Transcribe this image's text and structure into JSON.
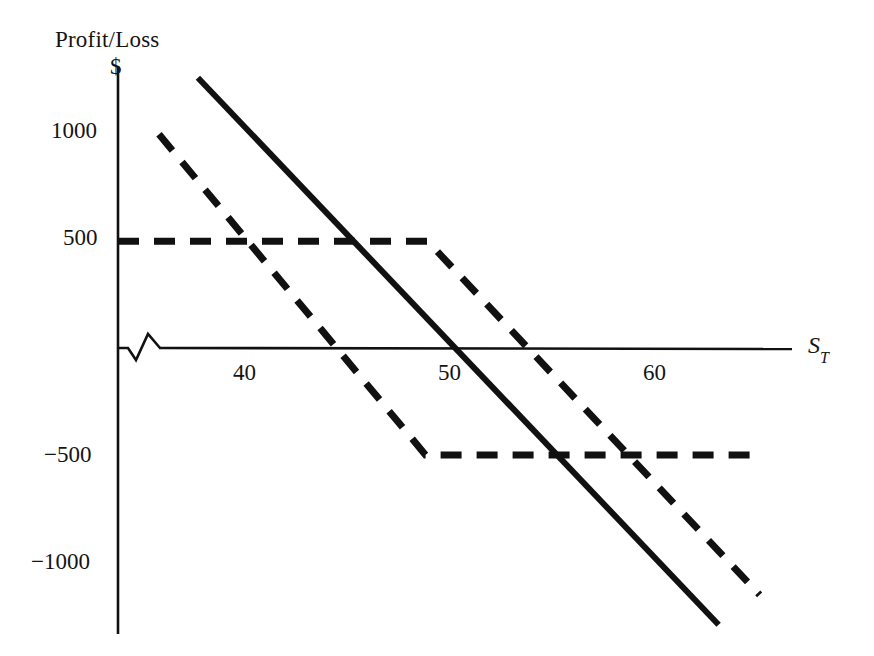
{
  "chart_data": {
    "type": "line",
    "title": "",
    "ylabel": "Profit/Loss",
    "yunit": "$",
    "xlabel": "S_T",
    "xlabel_base": "S",
    "xlabel_sub": "T",
    "xlim": [
      35,
      71
    ],
    "ylim": [
      -1300,
      1300
    ],
    "grid": false,
    "legend": "none",
    "axis_break_symbol": true,
    "yticks": [
      1000,
      500,
      -500,
      -1000
    ],
    "ytick_labels": [
      "1000",
      "500",
      "−500",
      "−1000"
    ],
    "xticks": [
      40,
      50,
      60
    ],
    "xtick_labels": [
      "40",
      "50",
      "60"
    ],
    "series": [
      {
        "name": "solid-payoff",
        "style": "solid",
        "color": "#111111",
        "width": 6,
        "points": [
          {
            "x": 38.9,
            "y": 1265
          },
          {
            "x": 64.3,
            "y": -1295
          }
        ]
      },
      {
        "name": "dashed-payoff-kink-down",
        "style": "dashed",
        "color": "#111111",
        "width": 7,
        "points": [
          {
            "x": 37.0,
            "y": 1000
          },
          {
            "x": 50.0,
            "y": -500
          },
          {
            "x": 66.3,
            "y": -500
          }
        ]
      },
      {
        "name": "dashed-payoff-kink-up",
        "style": "dashed",
        "color": "#111111",
        "width": 7,
        "points": [
          {
            "x": 35.0,
            "y": 500
          },
          {
            "x": 50.1,
            "y": 500
          },
          {
            "x": 66.3,
            "y": -1155
          }
        ]
      }
    ]
  },
  "axes": {
    "y_title": "Profit/Loss",
    "y_unit": "$",
    "x_title_base": "S",
    "x_title_sub": "T"
  },
  "ytick_items": [
    {
      "label": "1000",
      "value": 1000
    },
    {
      "label": "500",
      "value": 500
    },
    {
      "label": "−500",
      "value": -500
    },
    {
      "label": "−1000",
      "value": -1000
    }
  ],
  "xtick_items": [
    {
      "label": "40",
      "value": 40
    },
    {
      "label": "50",
      "value": 50
    },
    {
      "label": "60",
      "value": 60
    }
  ]
}
